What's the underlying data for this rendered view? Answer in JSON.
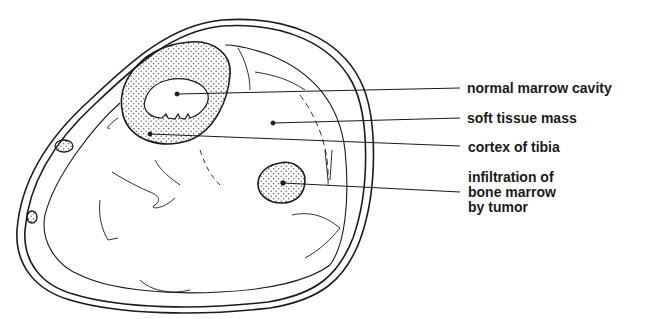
{
  "diagram": {
    "colors": {
      "line": "#1a1a1a",
      "stipple": "#555555",
      "background": "#ffffff"
    },
    "labels": [
      {
        "id": "normal-marrow-cavity",
        "text": "normal marrow cavity"
      },
      {
        "id": "soft-tissue-mass",
        "text": "soft tissue mass"
      },
      {
        "id": "cortex-of-tibia",
        "text": "cortex of tibia"
      },
      {
        "id": "infiltration",
        "lines": [
          "infiltration of",
          "bone marrow",
          "by tumor"
        ]
      }
    ]
  }
}
